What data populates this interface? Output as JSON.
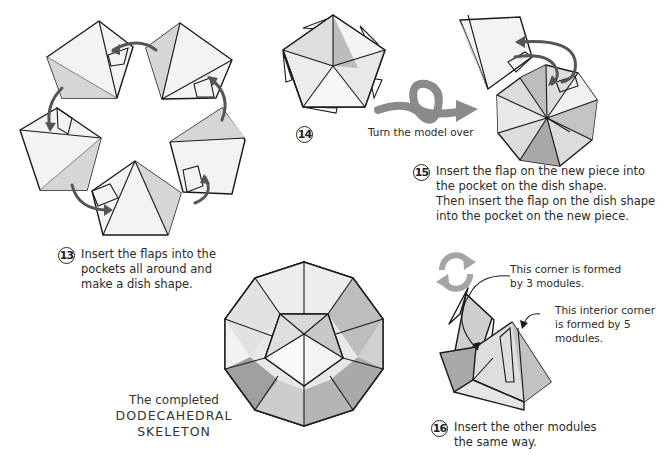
{
  "steps": [
    {
      "number": "13",
      "text_lines": [
        "Insert the flaps into the",
        "pockets all around and",
        "make a dish shape."
      ]
    },
    {
      "number": "14",
      "text_lines": []
    },
    {
      "number": "15",
      "text_lines": [
        "Insert the flap on the new piece into",
        "the pocket on the dish shape.",
        "Then insert the flap on the dish shape",
        "into the pocket on the new piece."
      ]
    },
    {
      "number": "16",
      "text_lines": [
        "Insert the other modules",
        "the same way."
      ]
    }
  ],
  "turn_over": {
    "label": "Turn the model over",
    "icon": "loop-arrow-icon"
  },
  "notes": {
    "corner3": [
      "This corner is formed",
      "by 3 modules."
    ],
    "corner5": [
      "This interior corner",
      "is formed by 5",
      "modules."
    ]
  },
  "completed": {
    "line1": "The completed",
    "line2": "DODECAHEDRAL",
    "line3": "SKELETON"
  },
  "rotate_icon": "rotate-arrows-icon",
  "colors": {
    "paper_light": "#f4f4f4",
    "paper_mid": "#d9d9d9",
    "paper_dark": "#b5b5b5",
    "arrow_gray": "#8a8a8a",
    "outline": "#1a1a1a"
  }
}
